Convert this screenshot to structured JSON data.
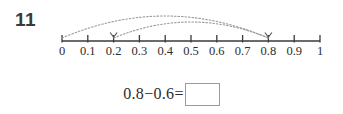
{
  "problem": {
    "number": "11"
  },
  "number_line": {
    "axis_start_value": 0,
    "axis_end_value": 1,
    "tick_labels": [
      "0",
      "0.1",
      "0.2",
      "0.3",
      "0.4",
      "0.5",
      "0.6",
      "0.7",
      "0.8",
      "0.9",
      "1"
    ],
    "line_color": "#3a3a3a",
    "arc_color": "#9b9b9b",
    "arcs": [
      {
        "name": "outer-arc",
        "from": "0",
        "to": "0.8"
      },
      {
        "name": "inner-arc",
        "from": "0.2",
        "to": "0.8"
      }
    ]
  },
  "equation": {
    "expression": "0.8−0.6=",
    "answer_value": "",
    "answer_placeholder": ""
  }
}
